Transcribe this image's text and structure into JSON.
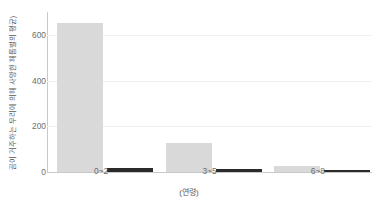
{
  "chart_data": {
    "type": "bar",
    "title": "",
    "categories": [
      "0~2",
      "3~5",
      "6~8"
    ],
    "series": [
      {
        "name": "series-1",
        "color": "#d9d9d9",
        "values": [
          650,
          125,
          25
        ]
      },
      {
        "name": "series-2",
        "color": "#2b2b2b",
        "values": [
          16,
          14,
          8
        ]
      }
    ],
    "xlabel": "(연령)",
    "ylabel": "곰이 거주하는 무리에 의해 사망한 해롭벌의 평균)",
    "yticks": [
      0,
      200,
      400,
      600
    ],
    "ylim": [
      0,
      700
    ],
    "grid": true,
    "legend": "none"
  },
  "axis": {
    "ytick_labels": [
      "0",
      "200",
      "400",
      "600"
    ],
    "xtick_labels": [
      "0~2",
      "3~5",
      "6~8"
    ],
    "xlabel_text": "(연령)",
    "ylabel_text": "곰이 거주하는 무리에 의해 사망한 해롭벌의 평균)"
  }
}
